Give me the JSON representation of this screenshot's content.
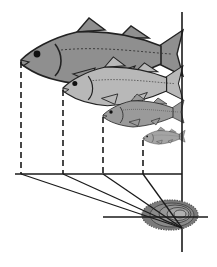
{
  "diagram": {
    "type": "fish-scale-back-calculation",
    "colors": {
      "background": "#ffffff",
      "line": "#1a1a1a",
      "fish_dark": "#8c8c8c",
      "fish_mid": "#a5a5a5",
      "fish_light": "#bdbdbd",
      "scale_fill": "#7d7d7d",
      "scale_ring": "#4a4a4a"
    },
    "fish": [
      {
        "name": "fish-age-4",
        "snout_x": 21,
        "snout_y": 60,
        "scale": 1.0,
        "fill": "#8f8f8f"
      },
      {
        "name": "fish-age-3",
        "snout_x": 63,
        "snout_y": 88,
        "scale": 0.74,
        "fill": "#b3b3b3"
      },
      {
        "name": "fish-age-2",
        "snout_x": 103,
        "snout_y": 115,
        "scale": 0.52,
        "fill": "#9a9a9a"
      },
      {
        "name": "fish-age-1",
        "snout_x": 143,
        "snout_y": 138,
        "scale": 0.3,
        "fill": "#a0a0a0"
      }
    ],
    "dashed_x": [
      21,
      63,
      103,
      143
    ],
    "baseline_y": 174,
    "vertical_axis_x": 182,
    "focus": {
      "x": 182,
      "y": 228
    },
    "scale_center": {
      "x": 172,
      "y": 215
    }
  }
}
